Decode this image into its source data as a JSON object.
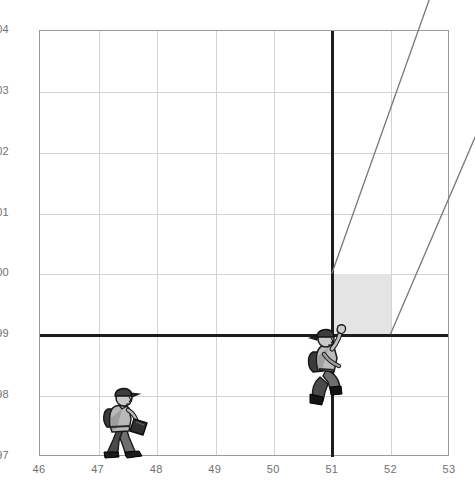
{
  "chart_data": {
    "type": "scatter",
    "title": "",
    "subtitle": "",
    "xlabel": "",
    "ylabel": "",
    "xlim": [
      46,
      53
    ],
    "ylim": [
      97,
      104
    ],
    "grid": true,
    "legend": null,
    "x_ticks": [
      "46",
      "47",
      "48",
      "49",
      "50",
      "51",
      "52",
      "53"
    ],
    "y_ticks": [
      "97",
      "98",
      "99",
      "00",
      "01",
      "02",
      "03",
      "04"
    ],
    "x_tick_values": [
      46,
      47,
      48,
      49,
      50,
      51,
      52,
      53
    ],
    "y_tick_values": [
      97,
      98,
      99,
      100,
      101,
      102,
      103,
      104
    ],
    "reference_lines": [
      {
        "name": "horizontal-reference-99",
        "orientation": "horizontal",
        "value": 99,
        "style": "bold",
        "color": "#1d1d1d"
      },
      {
        "name": "vertical-reference-51",
        "orientation": "vertical",
        "value": 51,
        "style": "bold",
        "color": "#1d1d1d",
        "from": 97,
        "to": 104
      }
    ],
    "shaded_region": {
      "name": "projection-box",
      "x_from": 51,
      "x_to": 52,
      "y_from": 99,
      "y_to": 100,
      "fill": "#e4e4e4"
    },
    "rays": [
      {
        "name": "ray-upper",
        "from": [
          51,
          100
        ],
        "to": [
          52.7,
          104.6
        ]
      },
      {
        "name": "ray-lower",
        "from": [
          52,
          99
        ],
        "to": [
          53.45,
          102.25
        ]
      }
    ],
    "markers": [
      {
        "name": "walking-businessman",
        "x": 47.45,
        "y": 97.55,
        "icon": "walking-person-icon"
      },
      {
        "name": "climbing-person",
        "x": 51,
        "y": 98.45,
        "icon": "climbing-person-icon"
      }
    ]
  },
  "axes": {
    "x": {
      "ticks": [
        {
          "label": "46",
          "value": 46
        },
        {
          "label": "47",
          "value": 47
        },
        {
          "label": "48",
          "value": 48
        },
        {
          "label": "49",
          "value": 49
        },
        {
          "label": "50",
          "value": 50
        },
        {
          "label": "51",
          "value": 51
        },
        {
          "label": "52",
          "value": 52
        },
        {
          "label": "53",
          "value": 53
        }
      ]
    },
    "y": {
      "ticks": [
        {
          "label": "97",
          "value": 97
        },
        {
          "label": "98",
          "value": 98
        },
        {
          "label": "99",
          "value": 99
        },
        {
          "label": "00",
          "value": 100
        },
        {
          "label": "01",
          "value": 101
        },
        {
          "label": "02",
          "value": 102
        },
        {
          "label": "03",
          "value": 103
        },
        {
          "label": "04",
          "value": 104
        }
      ]
    }
  },
  "colors": {
    "grid": "#d2d2d2",
    "frame": "#9a9a9a",
    "bold_line": "#1d1d1d",
    "shade": "#e4e4e4",
    "ray": "#777777",
    "tick_text": "#6f6f6f",
    "background": "#ffffff"
  }
}
